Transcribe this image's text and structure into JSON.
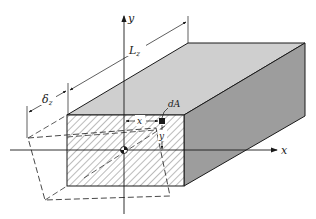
{
  "diagram": {
    "type": "isometric beam with twisted cross-section",
    "colors": {
      "top_face": "#cfcfcf",
      "side_face": "#9d9d9d",
      "front_face": "#ffffff",
      "hatch": "#555555",
      "line": "#1a1a1a"
    },
    "labels": {
      "y_axis": "y",
      "x_axis": "x",
      "length": "L",
      "length_sub": "z",
      "displacement": "δ",
      "displacement_sub": "z",
      "area_element": "dA",
      "x_distance": "x",
      "y_distance": "y"
    }
  }
}
